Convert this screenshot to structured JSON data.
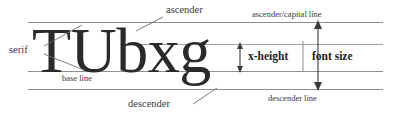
{
  "diagram": {
    "sample_text": "TUbxg",
    "colors": {
      "rule": "#8e8e8e",
      "text": "#2a2a2a",
      "label": "#3a3a3a",
      "label_bold": "#1d1d1d",
      "leader": "#6f6f6f",
      "background": "#ffffff"
    },
    "labels": {
      "ascender": "ascender",
      "ascender_capital_line": "ascender/capital line",
      "serif": "serif",
      "base_line": "base line",
      "x_height": "x-height",
      "font_size": "font size",
      "descender": "descender",
      "descender_line": "descender line"
    },
    "lines": [
      {
        "name": "ascender-capital-line",
        "label": "ascender/capital line",
        "y": 22
      },
      {
        "name": "x-height-line",
        "label": "x-height line",
        "y": 44
      },
      {
        "name": "base-line",
        "label": "base line",
        "y": 71
      },
      {
        "name": "descender-line",
        "label": "descender line",
        "y": 89
      }
    ],
    "measures": [
      {
        "name": "x-height",
        "label": "x-height",
        "from_y": 44,
        "to_y": 71
      },
      {
        "name": "font-size",
        "label": "font size",
        "from_y": 22,
        "to_y": 89
      }
    ]
  }
}
